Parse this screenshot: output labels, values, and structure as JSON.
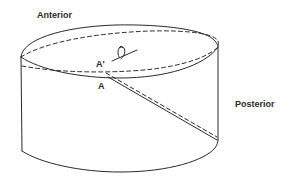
{
  "diagram": {
    "type": "cylinder-section-schematic",
    "labels": {
      "anterior": "Anterior",
      "posterior": "Posterior",
      "point_a_prime": "A'",
      "point_a": "A"
    },
    "icons": {
      "rotation": "rotation-arrow-icon"
    },
    "colors": {
      "stroke": "#2a2a2a",
      "background": "#ffffff"
    },
    "line_styles": {
      "outline": "solid",
      "section_plane": "dashed"
    }
  }
}
